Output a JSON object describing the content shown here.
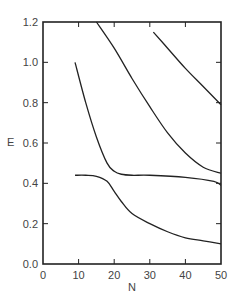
{
  "chart_data": {
    "type": "line",
    "title": "",
    "xlabel": "N",
    "ylabel": "E",
    "xlim": [
      0,
      50
    ],
    "ylim": [
      0.0,
      1.2
    ],
    "grid": false,
    "legend": null,
    "x_ticks": [
      "0",
      "10",
      "20",
      "30",
      "40",
      "50"
    ],
    "y_ticks": [
      "0.0",
      "0.2",
      "0.4",
      "0.6",
      "0.8",
      "1.0",
      "1.2"
    ],
    "series": [
      {
        "name": "curve-1",
        "x": [
          31,
          35,
          40,
          45,
          50
        ],
        "y": [
          1.15,
          1.07,
          0.97,
          0.88,
          0.79
        ]
      },
      {
        "name": "curve-2",
        "x": [
          15,
          20,
          25,
          30,
          35,
          40,
          45,
          50
        ],
        "y": [
          1.2,
          1.07,
          0.92,
          0.78,
          0.65,
          0.55,
          0.48,
          0.45
        ]
      },
      {
        "name": "curve-3",
        "x": [
          9,
          12,
          15,
          18,
          20,
          22,
          25,
          30,
          40,
          48,
          50
        ],
        "y": [
          1.0,
          0.8,
          0.63,
          0.5,
          0.46,
          0.445,
          0.44,
          0.44,
          0.43,
          0.41,
          0.39
        ]
      },
      {
        "name": "curve-4",
        "x": [
          9,
          12,
          15,
          18,
          20,
          22,
          25,
          30,
          35,
          40,
          45,
          50
        ],
        "y": [
          0.44,
          0.44,
          0.435,
          0.41,
          0.36,
          0.31,
          0.25,
          0.2,
          0.16,
          0.13,
          0.115,
          0.1
        ]
      }
    ]
  }
}
